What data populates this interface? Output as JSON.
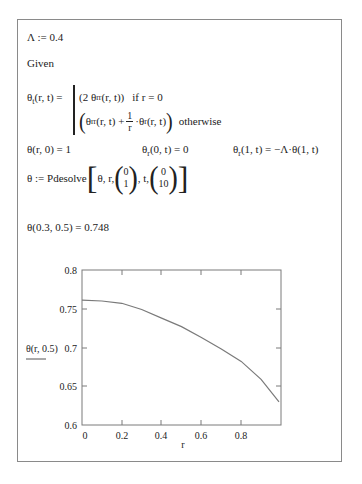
{
  "worksheet": {
    "lambda_def": "Λ := 0.4",
    "given": "Given",
    "pde": {
      "lhs": "θ",
      "lhs_sub": "t",
      "lhs_args": "(r, t) =",
      "case1_expr_pre": "(2 θ",
      "case1_sub": "rr",
      "case1_expr_post": "(r, t))",
      "case1_cond": "if  r = 0",
      "case2_pre": "θ",
      "case2_sub1": "rr",
      "case2_mid": "(r, t) +",
      "case2_frac_num": "1",
      "case2_frac_den": "r",
      "case2_post_pre": "·θ",
      "case2_sub2": "r",
      "case2_post": "(r, t)",
      "case2_cond": "otherwise"
    },
    "bc1": "θ(r, 0) = 1",
    "bc2_pre": "θ",
    "bc2_sub": "r",
    "bc2_post": "(0, t) = 0",
    "bc3_pre": "θ",
    "bc3_sub": "r",
    "bc3_post": "(1, t) = −Λ·θ(1, t)",
    "solve": {
      "lhs": "θ := Pdesolve",
      "args_pre": "θ, r,",
      "r_range": [
        "0",
        "1"
      ],
      "t_label": ", t,",
      "t_range": [
        "0",
        "10"
      ]
    },
    "eval": "θ(0.3, 0.5) = 0.748"
  },
  "chart_data": {
    "type": "line",
    "title": "",
    "xlabel": "r",
    "ylabel": "θ(r, 0.5)",
    "xlim": [
      0,
      1
    ],
    "ylim": [
      0.6,
      0.8
    ],
    "x_ticks": [
      "0",
      "0.2",
      "0.4",
      "0.6",
      "0.8"
    ],
    "y_ticks": [
      "0.6",
      "0.65",
      "0.7",
      "0.75",
      "0.8"
    ],
    "grid": false,
    "series": [
      {
        "name": "θ(r, 0.5)",
        "x": [
          0,
          0.1,
          0.2,
          0.3,
          0.4,
          0.5,
          0.6,
          0.7,
          0.8,
          0.9,
          0.99
        ],
        "values": [
          0.761,
          0.76,
          0.757,
          0.749,
          0.738,
          0.727,
          0.713,
          0.698,
          0.682,
          0.659,
          0.63
        ]
      }
    ],
    "line_color": "#7a7a7a"
  }
}
